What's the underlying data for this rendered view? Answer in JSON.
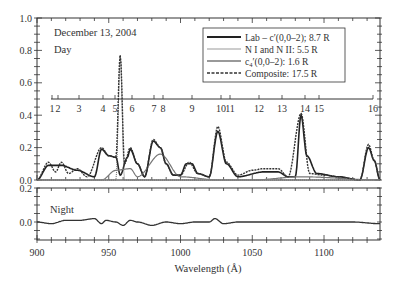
{
  "chart_data": [
    {
      "panel": "day",
      "type": "line",
      "title": "",
      "annotations": [
        "December 13, 2004",
        "Day"
      ],
      "xlabel": "Wavelength (Å)",
      "ylabel": "",
      "xlim": [
        900,
        1139
      ],
      "ylim": [
        0.0,
        1.0
      ],
      "yticks": [
        0.0,
        0.2,
        0.4,
        0.6,
        0.8,
        1.0
      ],
      "ytick_labels": [
        "0.0",
        "0.2",
        "0.4",
        "0.6",
        "0.8",
        "1.0"
      ],
      "grid": false,
      "legend_position": "upper right",
      "legend": [
        "Lab – c′(0,0–2); 8.7 R",
        "N I and N II: 5.5 R",
        "c4′(0,0–2): 1.6 R",
        "Composite: 17.5 R"
      ],
      "secondary_axis": {
        "ticks": [
          "1",
          "2",
          "3",
          "4",
          "5",
          "6",
          "7",
          "8",
          "9",
          "10",
          "11",
          "12",
          "13",
          "14",
          "15",
          "16"
        ],
        "wavelengths": [
          910,
          914,
          929,
          945,
          953,
          965,
          980,
          986,
          1006,
          1026,
          1032,
          1052,
          1068,
          1084,
          1094,
          1131
        ]
      },
      "series": [
        {
          "name": "Lab – c′(0,0–2); 8.7 R",
          "style": "solid-thick",
          "x": [
            900,
            908,
            917,
            928,
            940,
            945,
            950,
            955,
            958,
            963,
            965,
            970,
            975,
            981,
            986,
            990,
            995,
            1000,
            1004,
            1008,
            1012,
            1020,
            1026,
            1032,
            1040,
            1058,
            1068,
            1075,
            1080,
            1084,
            1088,
            1095,
            1110,
            1125,
            1131,
            1135,
            1139
          ],
          "values": [
            0.0,
            0.09,
            0.09,
            0.06,
            0.02,
            0.19,
            0.15,
            0.14,
            0.03,
            0.14,
            0.19,
            0.1,
            0.02,
            0.24,
            0.2,
            0.1,
            0.03,
            0.03,
            0.1,
            0.1,
            0.04,
            0.02,
            0.3,
            0.1,
            0.02,
            0.05,
            0.05,
            0.02,
            0.02,
            0.4,
            0.15,
            0.04,
            0.02,
            0.0,
            0.2,
            0.12,
            0.0
          ]
        },
        {
          "name": "N I and N II: 5.5 R",
          "style": "solid-thin",
          "x": [
            900,
            955,
            958,
            961,
            970,
            1000,
            1139
          ],
          "values": [
            0.0,
            0.0,
            0.77,
            0.0,
            0.0,
            0.0,
            0.0
          ]
        },
        {
          "name": "c4′(0,0–2): 1.6 R",
          "style": "solid-medium",
          "x": [
            900,
            945,
            955,
            965,
            970,
            986,
            1000,
            1026,
            1050,
            1084,
            1139
          ],
          "values": [
            0.0,
            0.0,
            0.06,
            0.07,
            0.02,
            0.16,
            0.02,
            0.0,
            0.0,
            0.02,
            0.0
          ]
        },
        {
          "name": "Composite: 17.5 R",
          "style": "dashed",
          "x": [
            900,
            908,
            913,
            917,
            922,
            928,
            935,
            945,
            950,
            955,
            958,
            961,
            965,
            970,
            975,
            981,
            986,
            990,
            995,
            1000,
            1006,
            1012,
            1020,
            1026,
            1032,
            1040,
            1050,
            1058,
            1068,
            1075,
            1084,
            1090,
            1100,
            1110,
            1125,
            1131,
            1135,
            1139
          ],
          "values": [
            0.0,
            0.11,
            0.05,
            0.11,
            0.04,
            0.07,
            0.02,
            0.2,
            0.15,
            0.14,
            0.77,
            0.1,
            0.2,
            0.1,
            0.02,
            0.25,
            0.2,
            0.1,
            0.03,
            0.03,
            0.11,
            0.04,
            0.02,
            0.33,
            0.11,
            0.03,
            0.06,
            0.07,
            0.07,
            0.02,
            0.41,
            0.04,
            0.03,
            0.02,
            0.0,
            0.22,
            0.12,
            0.0
          ]
        }
      ]
    },
    {
      "panel": "night",
      "type": "line",
      "annotations": [
        "Night"
      ],
      "xlabel": "Wavelength (Å)",
      "xlim": [
        900,
        1139
      ],
      "xticks": [
        900,
        950,
        1000,
        1050,
        1100
      ],
      "xtick_labels": [
        "900",
        "950",
        "1000",
        "1050",
        "1100"
      ],
      "ylim": [
        -0.1,
        0.2
      ],
      "yticks": [
        0.0,
        0.2
      ],
      "ytick_labels": [
        "0.0",
        "0.2"
      ],
      "series": [
        {
          "name": "Night",
          "x": [
            900,
            910,
            920,
            930,
            940,
            945,
            948,
            955,
            960,
            965,
            970,
            980,
            990,
            1000,
            1010,
            1020,
            1024,
            1030,
            1040,
            1060,
            1080,
            1100,
            1120,
            1139
          ],
          "values": [
            0.0,
            -0.01,
            0.01,
            0.01,
            0.02,
            -0.01,
            0.01,
            0.0,
            -0.02,
            0.01,
            0.0,
            -0.02,
            0.0,
            -0.01,
            0.0,
            0.0,
            0.02,
            -0.01,
            0.0,
            0.0,
            0.0,
            0.0,
            0.0,
            -0.01
          ]
        }
      ]
    }
  ],
  "labels": {
    "date": "December 13, 2004",
    "day": "Day",
    "night": "Night",
    "xlabel": "Wavelength (Å)"
  },
  "legend": {
    "items": [
      {
        "label": "Lab – c′(0,0–2); 8.7 R"
      },
      {
        "label": "N I and N II: 5.5 R"
      },
      {
        "label_main": "c",
        "label_sub": "4",
        "label_rest": "′(0,0–2): 1.6 R"
      },
      {
        "label": "Composite: 17.5 R"
      }
    ]
  },
  "axes": {
    "day_yticks": [
      "1.0",
      "0.8",
      "0.6",
      "0.4",
      "0.2",
      "0.0"
    ],
    "night_yticks": [
      "0.2",
      "0.0"
    ],
    "xticks": [
      "900",
      "950",
      "1000",
      "1050",
      "1100"
    ],
    "feature_ticks": [
      "1",
      "2",
      "3",
      "4",
      "5",
      "6",
      "7",
      "8",
      "9",
      "10",
      "11",
      "12",
      "13",
      "14",
      "15",
      "16"
    ]
  },
  "colors": {
    "lab": "#222222",
    "nitrogen": "#999999",
    "c4": "#777777",
    "composite": "#333333",
    "axis": "#333333"
  }
}
